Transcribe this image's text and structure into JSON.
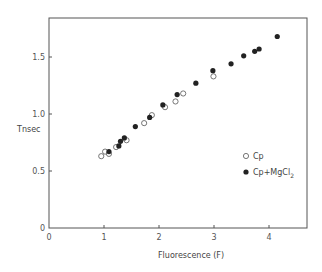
{
  "chart_data": {
    "type": "scatter",
    "title": "",
    "xlabel": "Fluorescence (F)",
    "ylabel": "Tnsec",
    "xlim": [
      0,
      4.7
    ],
    "ylim": [
      0,
      1.85
    ],
    "x_ticks": [
      "0",
      "1",
      "2",
      "3",
      "4"
    ],
    "y_ticks": [
      "0",
      "0.5",
      "1.0",
      "1.5"
    ],
    "grid": false,
    "legend_position": "right-middle",
    "series": [
      {
        "name": "Cp",
        "marker": "open-circle",
        "points": [
          [
            0.95,
            0.63
          ],
          [
            1.02,
            0.67
          ],
          [
            1.09,
            0.65
          ],
          [
            1.22,
            0.71
          ],
          [
            1.41,
            0.77
          ],
          [
            1.73,
            0.92
          ],
          [
            1.87,
            0.99
          ],
          [
            2.11,
            1.06
          ],
          [
            2.3,
            1.11
          ],
          [
            2.44,
            1.18
          ],
          [
            2.99,
            1.33
          ]
        ]
      },
      {
        "name": "Cp+MgCl2",
        "marker": "filled-circle",
        "points": [
          [
            1.09,
            0.67
          ],
          [
            1.27,
            0.72
          ],
          [
            1.3,
            0.76
          ],
          [
            1.37,
            0.79
          ],
          [
            1.57,
            0.89
          ],
          [
            1.83,
            0.97
          ],
          [
            2.07,
            1.08
          ],
          [
            2.33,
            1.17
          ],
          [
            2.67,
            1.27
          ],
          [
            2.98,
            1.38
          ],
          [
            3.31,
            1.44
          ],
          [
            3.54,
            1.51
          ],
          [
            3.74,
            1.55
          ],
          [
            3.82,
            1.57
          ],
          [
            4.15,
            1.68
          ]
        ]
      }
    ]
  },
  "legend": {
    "cp_label": "Cp",
    "cpmg_label": "Cp+MgCl",
    "cpmg_sub": "2"
  },
  "axes": {
    "xlabel": "Fluorescence (F)",
    "ylabel": "Tnsec",
    "x0_label": "0",
    "y0_label": "0"
  }
}
